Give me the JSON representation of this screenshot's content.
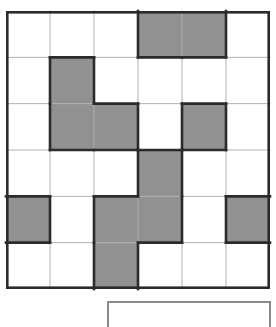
{
  "puzzle": {
    "title": "Shaded grid puzzle",
    "grid": {
      "rows": 6,
      "cols": 6,
      "cell_width": 44,
      "cell_height": 46.33,
      "origin_x": 6,
      "origin_y": 11,
      "shaded_color": "#919191",
      "empty_color": "#ffffff",
      "thin_line_color": "#b0b0b0",
      "thick_line_color": "#2b2b2b",
      "outer_border_color": "#2b2b2b",
      "cells": [
        [
          0,
          0,
          0,
          1,
          1,
          0
        ],
        [
          0,
          1,
          0,
          0,
          0,
          0
        ],
        [
          0,
          1,
          1,
          0,
          1,
          0
        ],
        [
          0,
          0,
          0,
          1,
          0,
          0
        ],
        [
          1,
          0,
          1,
          1,
          0,
          1
        ],
        [
          0,
          0,
          1,
          0,
          0,
          0
        ]
      ]
    },
    "footer_box": {
      "label": "",
      "border_color": "#8a8a8a",
      "fill_color": "#ffffff"
    }
  }
}
